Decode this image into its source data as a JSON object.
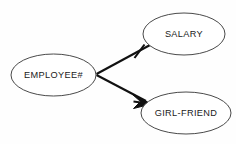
{
  "diagram": {
    "type": "entity-relationship-diagram",
    "notation": "crow's foot",
    "background_color": "#fefefe",
    "line_color": "#111111",
    "ellipse_stroke_color": "#4a4a4a",
    "ellipse_fill_color": "#ffffff",
    "text_color": "#1a1a1a",
    "entities": [
      {
        "id": "employee",
        "label": "EMPLOYEE#",
        "cx": 53.5,
        "cy": 75,
        "rx": 42.5,
        "ry": 21
      },
      {
        "id": "salary",
        "label": "SALARY",
        "cx": 184,
        "cy": 34,
        "rx": 41,
        "ry": 21
      },
      {
        "id": "girlfriend",
        "label": "GIRL-FRIEND",
        "cx": 186,
        "cy": 113,
        "rx": 45,
        "ry": 21
      }
    ],
    "relationships": [
      {
        "id": "employee-salary",
        "from": "employee",
        "to": "salary",
        "marker": "one-tick",
        "marker_label": "one",
        "x1": 96.5,
        "y1": 74,
        "x2": 150,
        "y2": 45
      },
      {
        "id": "employee-girlfriend",
        "from": "employee",
        "to": "girlfriend",
        "marker": "crows-foot",
        "marker_label": "many",
        "x1": 96.5,
        "y1": 75,
        "x2": 150,
        "y2": 103
      }
    ]
  }
}
